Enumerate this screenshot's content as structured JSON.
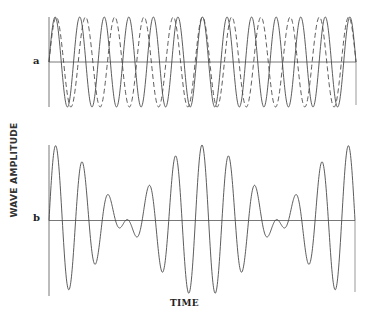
{
  "chart_data": {
    "type": "line",
    "title": "",
    "xlabel": "TIME",
    "ylabel": "WAVE AMPLITUDE",
    "grid": false,
    "legend": "none",
    "panels": [
      {
        "label": "a",
        "description": "Two component sine waves of slightly different frequency (solid and dashed)",
        "xlim": [
          0,
          1
        ],
        "ylim": [
          -1,
          1
        ],
        "series": [
          {
            "name": "wave 1",
            "style": "solid",
            "amplitude": 1,
            "cycles": 12.5,
            "phase": 0
          },
          {
            "name": "wave 2",
            "style": "dashed",
            "amplitude": 1,
            "cycles": 10.5,
            "phase": 0
          }
        ]
      },
      {
        "label": "b",
        "description": "Superposition (sum) of the two waves showing beats",
        "xlim": [
          0,
          1
        ],
        "ylim": [
          -2,
          2
        ],
        "series": [
          {
            "name": "sum",
            "style": "solid",
            "formula": "wave 1 + wave 2"
          }
        ]
      }
    ]
  },
  "labels": {
    "ylabel": "WAVE AMPLITUDE",
    "xlabel": "TIME",
    "panel_a": "a",
    "panel_b": "b"
  },
  "colors": {
    "line": "#4a4a4a",
    "axis": "#555555"
  }
}
